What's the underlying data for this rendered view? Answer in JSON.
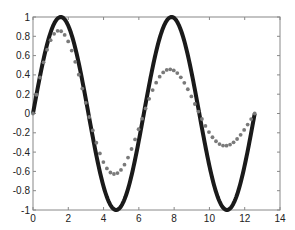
{
  "chart_data": {
    "type": "line",
    "title": "",
    "xlabel": "",
    "ylabel": "",
    "xlim": [
      0,
      14
    ],
    "ylim": [
      -1,
      1
    ],
    "grid": false,
    "legend": null,
    "x_ticks": [
      0,
      2,
      4,
      6,
      8,
      10,
      12,
      14
    ],
    "y_ticks": [
      -1,
      -0.8,
      -0.6,
      -0.4,
      -0.2,
      0,
      0.2,
      0.4,
      0.6,
      0.8,
      1
    ],
    "x_tick_labels": [
      "0",
      "2",
      "4",
      "6",
      "8",
      "10",
      "12",
      "14"
    ],
    "y_tick_labels": [
      "-1",
      "-0.8",
      "-0.6",
      "-0.4",
      "-0.2",
      "0",
      "0.2",
      "0.4",
      "0.6",
      "0.8",
      "1"
    ],
    "series": [
      {
        "name": "sin(x)",
        "style": "solid-thick",
        "color": "#1a1a1a",
        "function": "sin(x)",
        "x_range": [
          0,
          12.566
        ],
        "key_points": [
          [
            0,
            0
          ],
          [
            1.571,
            1
          ],
          [
            3.142,
            0
          ],
          [
            4.712,
            -1
          ],
          [
            6.283,
            0
          ],
          [
            7.854,
            1
          ],
          [
            9.425,
            0
          ],
          [
            10.996,
            -1
          ],
          [
            12.566,
            0
          ]
        ]
      },
      {
        "name": "exp(-0.1x)·sin(x)",
        "style": "markers-asterisk",
        "color": "#7a7a7a",
        "function": "exp(-0.1*x)*sin(x)",
        "x_range": [
          0,
          12.566
        ],
        "key_points": [
          [
            0,
            0
          ],
          [
            1.571,
            0.85
          ],
          [
            3.142,
            0
          ],
          [
            4.712,
            -0.63
          ],
          [
            6.283,
            0
          ],
          [
            7.854,
            0.45
          ],
          [
            9.425,
            0
          ],
          [
            10.996,
            -0.33
          ],
          [
            12.566,
            0
          ]
        ]
      }
    ]
  }
}
